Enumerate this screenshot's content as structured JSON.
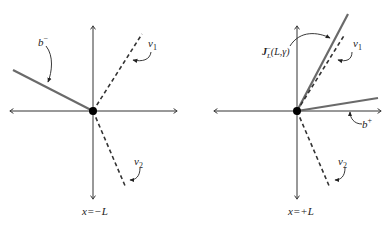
{
  "colors": {
    "axis": "#333333",
    "solid_line": "#6a6a6a",
    "dashed_line": "#333333",
    "point": "#000000",
    "background": "#ffffff"
  },
  "panels": [
    {
      "id": "left",
      "caption": "x=−L",
      "labels": {
        "b": "b",
        "b_sup": "−",
        "v1": "v",
        "v1_sub": "1",
        "v2": "v",
        "v2_sub": "2"
      }
    },
    {
      "id": "right",
      "caption": "x=+L",
      "labels": {
        "J": "J",
        "J_sup": "−",
        "J_sub": "L",
        "J_args": "(L,γ)",
        "b": "b",
        "b_sup": "+",
        "v1": "v",
        "v1_sub": "1",
        "v2": "v",
        "v2_sub": "2"
      }
    }
  ]
}
